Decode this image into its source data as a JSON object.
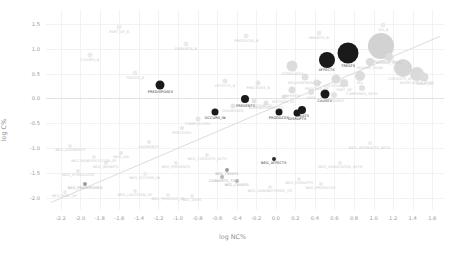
{
  "chart_data": {
    "type": "scatter",
    "title": "",
    "xlabel": "log NC%",
    "ylabel": "log C%",
    "xlim": [
      -2.35,
      1.72
    ],
    "ylim": [
      -2.25,
      1.78
    ],
    "grid": true,
    "legend": "none",
    "xticks": [
      "-2.2",
      "-2.0",
      "-1.8",
      "-1.6",
      "-1.4",
      "-1.2",
      "-1.0",
      "-0.8",
      "-0.6",
      "-0.4",
      "-0.2",
      "0.0",
      "0.2",
      "0.4",
      "0.6",
      "0.8",
      "1.0",
      "1.2",
      "1.4",
      "1.6"
    ],
    "xtick_values": [
      -2.2,
      -2.0,
      -1.8,
      -1.6,
      -1.4,
      -1.2,
      -1.0,
      -0.8,
      -0.6,
      -0.4,
      -0.2,
      0.0,
      0.2,
      0.4,
      0.6,
      0.8,
      1.0,
      1.2,
      1.4,
      1.6
    ],
    "yticks": [
      "1.5",
      "1.0",
      "0.5",
      "0.0",
      "-0.5",
      "-1.0",
      "-1.5",
      "-2.0"
    ],
    "ytick_values": [
      1.5,
      1.0,
      0.5,
      0.0,
      -0.5,
      -1.0,
      -1.5,
      -2.0
    ],
    "reference_line": {
      "type": "diagonal",
      "from": [
        -2.3,
        -2.1
      ],
      "to": [
        1.68,
        1.25
      ],
      "color": "#dcdcdc"
    },
    "points": [
      {
        "label": "PREDISPOSES",
        "x": -1.18,
        "y": 0.26,
        "size": 9,
        "color": "#1a1a1a",
        "label_style": "dark"
      },
      {
        "label": "OCCURS_IN",
        "x": -0.62,
        "y": -0.27,
        "size": 7,
        "color": "#1a1a1a",
        "label_style": "dark"
      },
      {
        "label": "PREVENTS",
        "x": -0.31,
        "y": -0.02,
        "size": 8,
        "color": "#1a1a1a",
        "label_style": "dark"
      },
      {
        "label": "PRODUCES",
        "x": 0.03,
        "y": -0.28,
        "size": 7,
        "color": "#1a1a1a",
        "label_style": "dark"
      },
      {
        "label": "TREATS",
        "x": 0.27,
        "y": -0.23,
        "size": 8,
        "color": "#1a1a1a",
        "label_style": "dark"
      },
      {
        "label": "DISRUPTS",
        "x": 0.22,
        "y": -0.3,
        "size": 7,
        "color": "#1a1a1a",
        "label_style": "dark"
      },
      {
        "label": "CAUSES",
        "x": 0.5,
        "y": 0.08,
        "size": 9,
        "color": "#1a1a1a",
        "label_style": "dark"
      },
      {
        "label": "AFFECTS",
        "x": 0.52,
        "y": 0.78,
        "size": 16,
        "color": "#1a1a1a",
        "label_style": "dark"
      },
      {
        "label": "TREATS",
        "x": 0.74,
        "y": 0.92,
        "size": 21,
        "color": "#1a1a1a",
        "label_style": "dark"
      },
      {
        "label": "NEG_AFFECTS",
        "x": -0.02,
        "y": -1.22,
        "size": 4,
        "color": "#2b2b2b",
        "label_style": "dark"
      },
      {
        "label": "NEG_TREATS",
        "x": -0.5,
        "y": -1.44,
        "size": 4,
        "color": "#9b9b9b",
        "label_style": "mid"
      },
      {
        "label": "CONVERTS_TO",
        "x": -0.55,
        "y": -1.58,
        "size": 4,
        "color": "#b5b5b5",
        "label_style": "mid"
      },
      {
        "label": "NEG_CAUSES",
        "x": -0.4,
        "y": -1.66,
        "size": 4,
        "color": "#b5b5b5",
        "label_style": "mid"
      },
      {
        "label": "NEG_PREDISPOSES",
        "x": -1.95,
        "y": -1.72,
        "size": 4,
        "color": "#9b9b9b",
        "label_style": "mid"
      },
      {
        "label": "INTERACTS_WITH",
        "x": 1.08,
        "y": 1.05,
        "size": 26,
        "color": "#d2d2d2",
        "label_style": "faint"
      },
      {
        "label": "COEXISTS_WITH",
        "x": 1.3,
        "y": 0.62,
        "size": 18,
        "color": "#d6d6d6",
        "label_style": "faint"
      },
      {
        "label": "ASSOCIATED_WITH",
        "x": 1.44,
        "y": 0.5,
        "size": 14,
        "color": "#dadada",
        "label_style": "faint"
      },
      {
        "label": "STIMULATES",
        "x": 0.17,
        "y": 0.66,
        "size": 11,
        "color": "#dcdcdc",
        "label_style": "faint"
      },
      {
        "label": "INHIBITS",
        "x": 0.17,
        "y": 0.16,
        "size": 7,
        "color": "#dedede",
        "label_style": "faint"
      },
      {
        "label": "LOCATION_OF",
        "x": 0.62,
        "y": 0.38,
        "size": 9,
        "color": "#dcdcdc",
        "label_style": "faint"
      },
      {
        "label": "PART_OF",
        "x": 0.7,
        "y": 0.3,
        "size": 8,
        "color": "#dedede",
        "label_style": "faint"
      },
      {
        "label": "ISA",
        "x": 0.86,
        "y": 0.46,
        "size": 10,
        "color": "#dcdcdc",
        "label_style": "faint"
      },
      {
        "label": "PROCESS_OF",
        "x": 0.42,
        "y": 0.3,
        "size": 7,
        "color": "#e0e0e0",
        "label_style": "faint"
      },
      {
        "label": "USES",
        "x": 0.36,
        "y": 0.12,
        "size": 6,
        "color": "#e0e0e0",
        "label_style": "faint"
      },
      {
        "label": "METHOD_OF",
        "x": 0.08,
        "y": 0.02,
        "size": 5,
        "color": "#e2e2e2",
        "label_style": "faint"
      },
      {
        "label": "ADMINISTERED_TO",
        "x": -0.1,
        "y": -0.1,
        "size": 5,
        "color": "#e2e2e2",
        "label_style": "faint"
      },
      {
        "label": "MANIFESTATION_OF",
        "x": -0.22,
        "y": -0.06,
        "size": 5,
        "color": "#e4e4e4",
        "label_style": "faint"
      },
      {
        "label": "DIAGNOSES",
        "x": -0.44,
        "y": -0.16,
        "size": 5,
        "color": "#e4e4e4",
        "label_style": "faint"
      },
      {
        "label": "COMPLICATES",
        "x": -0.8,
        "y": -0.42,
        "size": 5,
        "color": "#e6e6e6",
        "label_style": "faint"
      },
      {
        "label": "PRECEDES",
        "x": -0.96,
        "y": -0.6,
        "size": 4,
        "color": "#e6e6e6",
        "label_style": "faint"
      },
      {
        "label": "AUGMENTS",
        "x": -1.3,
        "y": -0.88,
        "size": 4,
        "color": "#e8e8e8",
        "label_style": "faint"
      },
      {
        "label": "NEG_ISA",
        "x": -1.58,
        "y": -1.1,
        "size": 4,
        "color": "#e8e8e8",
        "label_style": "faint"
      },
      {
        "label": "NEG_INHIBITS",
        "x": -1.74,
        "y": -1.3,
        "size": 4,
        "color": "#eaeaea",
        "label_style": "faint"
      },
      {
        "label": "NEG_STIMULATES",
        "x": -2.02,
        "y": -1.46,
        "size": 4,
        "color": "#eaeaea",
        "label_style": "faint"
      },
      {
        "label": "NEG_PART_OF",
        "x": -2.16,
        "y": -1.88,
        "size": 4,
        "color": "#ececec",
        "label_style": "faint"
      },
      {
        "label": "NEG_LOCATION_OF",
        "x": -1.44,
        "y": -1.86,
        "size": 4,
        "color": "#ececec",
        "label_style": "faint"
      },
      {
        "label": "NEG_PROCESS_OF",
        "x": -1.1,
        "y": -1.94,
        "size": 4,
        "color": "#ececec",
        "label_style": "faint"
      },
      {
        "label": "NEG_USES",
        "x": -0.86,
        "y": -1.96,
        "size": 4,
        "color": "#ececec",
        "label_style": "faint"
      },
      {
        "label": "NEG_OCCURS_IN",
        "x": -1.34,
        "y": -1.52,
        "size": 4,
        "color": "#ececec",
        "label_style": "faint"
      },
      {
        "label": "NEG_COEXISTS_WITH",
        "x": -0.7,
        "y": -1.14,
        "size": 4,
        "color": "#eaeaea",
        "label_style": "faint"
      },
      {
        "label": "NEG_PREVENTS",
        "x": -1.02,
        "y": -1.3,
        "size": 4,
        "color": "#ececec",
        "label_style": "faint"
      },
      {
        "label": "NEG_DISRUPTS",
        "x": 0.24,
        "y": -1.62,
        "size": 4,
        "color": "#ececec",
        "label_style": "faint"
      },
      {
        "label": "NEG_PRODUCES",
        "x": 0.46,
        "y": -1.72,
        "size": 4,
        "color": "#ececec",
        "label_style": "faint"
      },
      {
        "label": "NEG_ASSOCIATED_WITH",
        "x": 0.66,
        "y": -1.3,
        "size": 4,
        "color": "#ececec",
        "label_style": "faint"
      },
      {
        "label": "NEG_INTERACTS_WITH",
        "x": 0.96,
        "y": -0.9,
        "size": 4,
        "color": "#ececec",
        "label_style": "faint"
      },
      {
        "label": "NEG_ADMINISTERED_TO",
        "x": -0.06,
        "y": -1.78,
        "size": 4,
        "color": "#ececec",
        "label_style": "faint"
      },
      {
        "label": "NEG_MANIFESTATION_OF",
        "x": -1.86,
        "y": -1.18,
        "size": 4,
        "color": "#ececec",
        "label_style": "faint"
      },
      {
        "label": "NEG_AUGMENTS",
        "x": -2.1,
        "y": -0.96,
        "size": 4,
        "color": "#ececec",
        "label_style": "faint"
      },
      {
        "label": "HIGHER_THAN",
        "x": 0.96,
        "y": 0.74,
        "size": 8,
        "color": "#dcdcdc",
        "label_style": "faint"
      },
      {
        "label": "LOWER_THAN",
        "x": 1.16,
        "y": 0.84,
        "size": 8,
        "color": "#dcdcdc",
        "label_style": "faint"
      },
      {
        "label": "SAME_AS",
        "x": 1.52,
        "y": 0.44,
        "size": 9,
        "color": "#dcdcdc",
        "label_style": "faint"
      },
      {
        "label": "COMPARED_WITH",
        "x": 0.88,
        "y": 0.2,
        "size": 6,
        "color": "#e2e2e2",
        "label_style": "faint"
      },
      {
        "label": "MEASURES",
        "x": 0.6,
        "y": 0.06,
        "size": 6,
        "color": "#e2e2e2",
        "label_style": "faint"
      },
      {
        "label": "MEASUREMENT_OF",
        "x": 0.3,
        "y": 0.44,
        "size": 7,
        "color": "#e0e0e0",
        "label_style": "faint"
      },
      {
        "label": "PRECEDES_B",
        "x": -0.18,
        "y": 0.3,
        "size": 5,
        "color": "#e6e6e6",
        "label_style": "faint"
      },
      {
        "label": "AFFECTS_B",
        "x": -0.52,
        "y": 0.34,
        "size": 5,
        "color": "#e8e8e8",
        "label_style": "faint"
      },
      {
        "label": "TREATS_B",
        "x": -1.44,
        "y": 0.52,
        "size": 5,
        "color": "#ececec",
        "label_style": "faint"
      },
      {
        "label": "CAUSES_B",
        "x": -1.9,
        "y": 0.88,
        "size": 5,
        "color": "#ececec",
        "label_style": "faint"
      },
      {
        "label": "DISRUPTS_B",
        "x": -0.92,
        "y": 1.1,
        "size": 5,
        "color": "#ececec",
        "label_style": "faint"
      },
      {
        "label": "PRODUCES_B",
        "x": -0.3,
        "y": 1.26,
        "size": 5,
        "color": "#ececec",
        "label_style": "faint"
      },
      {
        "label": "INHIBITS_B",
        "x": 0.44,
        "y": 1.32,
        "size": 5,
        "color": "#ececec",
        "label_style": "faint"
      },
      {
        "label": "ISA_B",
        "x": 1.1,
        "y": 1.48,
        "size": 5,
        "color": "#ececec",
        "label_style": "faint"
      },
      {
        "label": "PART_OF_B",
        "x": -1.6,
        "y": 1.44,
        "size": 5,
        "color": "#ececec",
        "label_style": "faint"
      }
    ]
  }
}
